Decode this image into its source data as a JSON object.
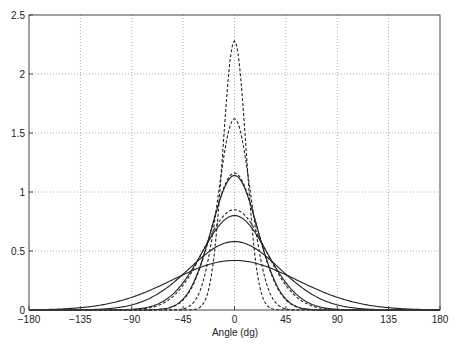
{
  "chart_data": {
    "type": "line",
    "title": "",
    "xlabel": "Angle  (dg)",
    "ylabel": "",
    "xlim": [
      -180,
      180
    ],
    "ylim": [
      0,
      2.5
    ],
    "xticks": [
      -180,
      -135,
      -90,
      -45,
      0,
      45,
      90,
      135,
      180
    ],
    "xtick_labels": [
      "−180",
      "−135",
      "−90",
      "−45",
      "0",
      "45",
      "90",
      "135",
      "180"
    ],
    "yticks": [
      0,
      0.5,
      1,
      1.5,
      2,
      2.5
    ],
    "ytick_labels": [
      "0",
      "0.5",
      "1",
      "1.5",
      "2",
      "2.5"
    ],
    "grid": true,
    "grid_style": "dotted",
    "legend": null,
    "series": [
      {
        "name": "solid-1",
        "style": "solid",
        "peak": 0.42,
        "center": 0,
        "sigma_deg": 54.5
      },
      {
        "name": "solid-2",
        "style": "solid",
        "peak": 0.58,
        "center": 0,
        "sigma_deg": 39.5
      },
      {
        "name": "solid-3",
        "style": "solid",
        "peak": 0.8,
        "center": 0,
        "sigma_deg": 28.6
      },
      {
        "name": "solid-4",
        "style": "solid",
        "peak": 1.14,
        "center": 0,
        "sigma_deg": 20.1
      },
      {
        "name": "dashed-1",
        "style": "dashed",
        "peak": 0.85,
        "center": 0,
        "sigma_deg": 26.9
      },
      {
        "name": "dashed-2",
        "style": "dashed",
        "peak": 1.16,
        "center": 0,
        "sigma_deg": 19.7
      },
      {
        "name": "dashed-3",
        "style": "dashed",
        "peak": 1.62,
        "center": 0,
        "sigma_deg": 14.1
      },
      {
        "name": "dashed-4",
        "style": "dashed",
        "peak": 2.28,
        "center": 0,
        "sigma_deg": 10.0
      }
    ],
    "colors": {
      "line": "#222222",
      "grid": "#999999",
      "axis": "#444444"
    }
  }
}
